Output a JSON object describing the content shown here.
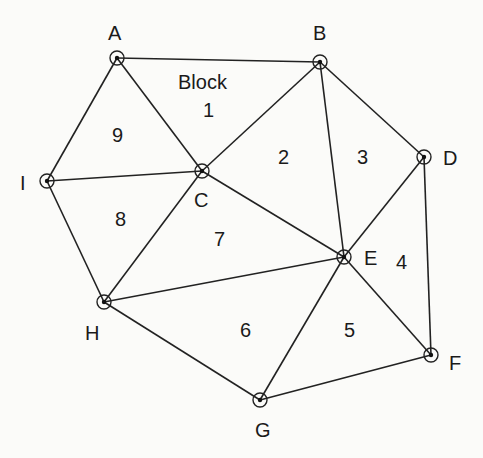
{
  "diagram": {
    "nodes": [
      {
        "id": "A",
        "x": 117,
        "y": 58,
        "lx": 108,
        "ly": 40
      },
      {
        "id": "B",
        "x": 320,
        "y": 62,
        "lx": 313,
        "ly": 40
      },
      {
        "id": "C",
        "x": 202,
        "y": 171,
        "lx": 194,
        "ly": 207
      },
      {
        "id": "D",
        "x": 424,
        "y": 157,
        "lx": 443,
        "ly": 165
      },
      {
        "id": "E",
        "x": 344,
        "y": 257,
        "lx": 364,
        "ly": 265
      },
      {
        "id": "F",
        "x": 431,
        "y": 355,
        "lx": 449,
        "ly": 370
      },
      {
        "id": "G",
        "x": 260,
        "y": 400,
        "lx": 255,
        "ly": 437
      },
      {
        "id": "H",
        "x": 104,
        "y": 302,
        "lx": 85,
        "ly": 340
      },
      {
        "id": "I",
        "x": 47,
        "y": 181,
        "lx": 20,
        "ly": 190
      }
    ],
    "edges": [
      [
        "A",
        "B"
      ],
      [
        "A",
        "I"
      ],
      [
        "A",
        "C"
      ],
      [
        "I",
        "C"
      ],
      [
        "I",
        "H"
      ],
      [
        "B",
        "C"
      ],
      [
        "B",
        "E"
      ],
      [
        "B",
        "D"
      ],
      [
        "D",
        "E"
      ],
      [
        "D",
        "F"
      ],
      [
        "C",
        "H"
      ],
      [
        "C",
        "E"
      ],
      [
        "H",
        "E"
      ],
      [
        "H",
        "G"
      ],
      [
        "E",
        "G"
      ],
      [
        "E",
        "F"
      ],
      [
        "G",
        "F"
      ]
    ],
    "block_title": {
      "text": "Block",
      "x": 178,
      "y": 89
    },
    "blocks": [
      {
        "label": "1",
        "x": 203,
        "y": 117
      },
      {
        "label": "2",
        "x": 278,
        "y": 164
      },
      {
        "label": "3",
        "x": 357,
        "y": 164
      },
      {
        "label": "4",
        "x": 396,
        "y": 269
      },
      {
        "label": "5",
        "x": 344,
        "y": 337
      },
      {
        "label": "6",
        "x": 240,
        "y": 337
      },
      {
        "label": "7",
        "x": 214,
        "y": 246
      },
      {
        "label": "8",
        "x": 115,
        "y": 226
      },
      {
        "label": "9",
        "x": 112,
        "y": 142
      }
    ]
  }
}
